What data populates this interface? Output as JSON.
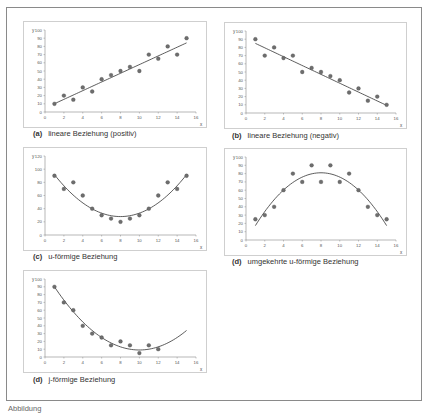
{
  "figure": {
    "caption_partial": "Abbildung"
  },
  "chart_data": [
    {
      "id": "a",
      "type": "scatter",
      "panel_letter": "(a)",
      "title": "lineare Beziehung (positiv)",
      "xlabel": "x",
      "ylabel": "y",
      "xlim": [
        0,
        16
      ],
      "ylim": [
        0,
        100
      ],
      "xticks": [
        0,
        2,
        4,
        6,
        8,
        10,
        12,
        14,
        16
      ],
      "yticks": [
        0,
        10,
        20,
        30,
        40,
        50,
        60,
        70,
        80,
        90,
        100
      ],
      "x": [
        1,
        2,
        3,
        4,
        5,
        6,
        7,
        8,
        9,
        10,
        11,
        12,
        13,
        14,
        15
      ],
      "y": [
        10,
        20,
        15,
        30,
        25,
        40,
        45,
        50,
        55,
        50,
        70,
        65,
        80,
        70,
        90
      ],
      "trend": {
        "kind": "linear",
        "coef": [
          4.8,
          5.3
        ],
        "x_range": [
          1,
          15
        ]
      },
      "grid": false
    },
    {
      "id": "b",
      "type": "scatter",
      "panel_letter": "(b)",
      "title": "lineare Beziehung (negativ)",
      "xlabel": "x",
      "ylabel": "y",
      "xlim": [
        0,
        16
      ],
      "ylim": [
        0,
        100
      ],
      "xticks": [
        0,
        2,
        4,
        6,
        8,
        10,
        12,
        14,
        16
      ],
      "yticks": [
        0,
        10,
        20,
        30,
        40,
        50,
        60,
        70,
        80,
        90,
        100
      ],
      "x": [
        1,
        2,
        3,
        4,
        5,
        6,
        7,
        8,
        9,
        10,
        11,
        12,
        13,
        14,
        15
      ],
      "y": [
        90,
        70,
        80,
        67,
        70,
        50,
        55,
        50,
        45,
        40,
        25,
        30,
        15,
        20,
        10
      ],
      "trend": {
        "kind": "linear",
        "coef": [
          90.3,
          -5.4
        ],
        "x_range": [
          1,
          15
        ]
      },
      "grid": false
    },
    {
      "id": "c",
      "type": "scatter",
      "panel_letter": "(c)",
      "title": "u-förmige Beziehung",
      "xlabel": "x",
      "ylabel": "y",
      "xlim": [
        0,
        16
      ],
      "ylim": [
        0,
        120
      ],
      "xticks": [
        0,
        2,
        4,
        6,
        8,
        10,
        12,
        14,
        16
      ],
      "yticks": [
        0,
        20,
        40,
        60,
        80,
        100,
        120
      ],
      "x": [
        1,
        2,
        3,
        4,
        5,
        6,
        7,
        8,
        9,
        10,
        11,
        12,
        13,
        14,
        15
      ],
      "y": [
        90,
        70,
        80,
        60,
        40,
        30,
        25,
        20,
        25,
        30,
        40,
        60,
        80,
        70,
        90
      ],
      "trend": {
        "kind": "quadratic",
        "vertex_x": 8,
        "vertex_y": 28,
        "a": 1.3,
        "x_range": [
          1,
          15
        ]
      },
      "grid": false
    },
    {
      "id": "d",
      "type": "scatter",
      "panel_letter": "(d)",
      "title": "umgekehrte u-förmige Beziehung",
      "xlabel": "x",
      "ylabel": "y",
      "xlim": [
        0,
        16
      ],
      "ylim": [
        0,
        100
      ],
      "xticks": [
        0,
        2,
        4,
        6,
        8,
        10,
        12,
        14,
        16
      ],
      "yticks": [
        0,
        10,
        20,
        30,
        40,
        50,
        60,
        70,
        80,
        90,
        100
      ],
      "x": [
        1,
        2,
        3,
        4,
        5,
        6,
        7,
        8,
        9,
        10,
        11,
        12,
        13,
        14,
        15
      ],
      "y": [
        25,
        30,
        40,
        60,
        80,
        70,
        90,
        70,
        90,
        70,
        80,
        60,
        40,
        30,
        25
      ],
      "trend": {
        "kind": "quadratic",
        "vertex_x": 8,
        "vertex_y": 81,
        "a": -1.3,
        "x_range": [
          1,
          15
        ]
      },
      "grid": false
    },
    {
      "id": "j",
      "type": "scatter",
      "panel_letter": "(d)",
      "title": "j-förmige Beziehung",
      "xlabel": "x",
      "ylabel": "y",
      "xlim": [
        0,
        16
      ],
      "ylim": [
        0,
        100
      ],
      "xticks": [
        0,
        2,
        4,
        6,
        8,
        10,
        12,
        14,
        16
      ],
      "yticks": [
        0,
        10,
        20,
        30,
        40,
        50,
        60,
        70,
        80,
        90,
        100
      ],
      "x": [
        1,
        2,
        3,
        4,
        5,
        6,
        7,
        8,
        9,
        10,
        11,
        12
      ],
      "y": [
        90,
        70,
        60,
        40,
        30,
        25,
        15,
        20,
        15,
        5,
        15,
        10
      ],
      "trend": {
        "kind": "quadratic",
        "vertex_x": 10,
        "vertex_y": 9,
        "a": 1.0,
        "x_range": [
          1,
          15
        ]
      },
      "grid": false
    }
  ]
}
